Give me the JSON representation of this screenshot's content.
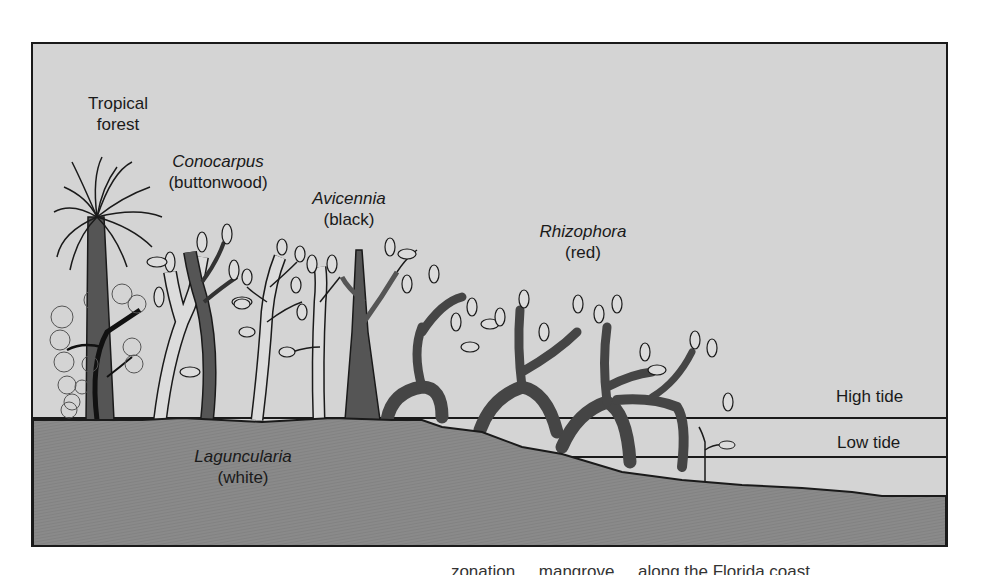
{
  "figure": {
    "labels": {
      "tropical_forest": {
        "line1": "Tropical",
        "line2": "forest"
      },
      "conocarpus": {
        "genus": "Conocarpus",
        "common": "(buttonwood)"
      },
      "avicennia": {
        "genus": "Avicennia",
        "common": "(black)"
      },
      "rhizophora": {
        "genus": "Rhizophora",
        "common": "(red)"
      },
      "laguncularia": {
        "genus": "Laguncularia",
        "common": "(white)"
      }
    },
    "tide_lines": {
      "high": "High tide",
      "low": "Low tide"
    },
    "caption_partial": "... zonation ... mangrove ... along the Florida coast"
  },
  "colors": {
    "sky": "#d4d4d4",
    "ground": "#8c8c8c",
    "dark_trunk": "#555555",
    "light_trunk": "#d9d9d9",
    "outline": "#1a1a1a"
  }
}
